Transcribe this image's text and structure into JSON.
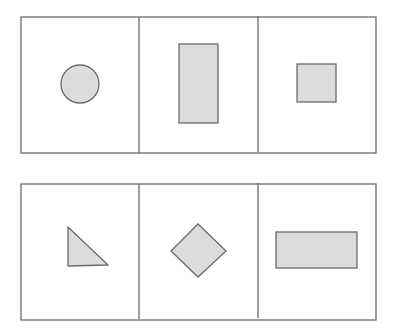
{
  "colors": {
    "background": "#ffffff",
    "stroke": "#6b6b6b",
    "fill": "#dcdcdc"
  },
  "rows": [
    {
      "name": "top-row",
      "cells": [
        {
          "shape": "circle"
        },
        {
          "shape": "tall-rectangle"
        },
        {
          "shape": "square"
        }
      ]
    },
    {
      "name": "bottom-row",
      "cells": [
        {
          "shape": "right-triangle"
        },
        {
          "shape": "diamond"
        },
        {
          "shape": "wide-rectangle"
        }
      ]
    }
  ]
}
